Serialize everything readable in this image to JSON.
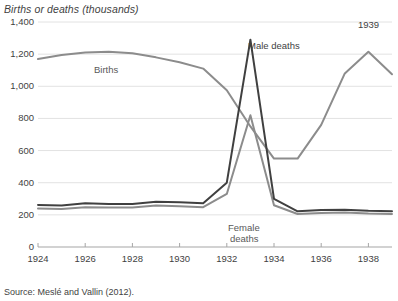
{
  "axis_title": "Births or deaths (thousands)",
  "source_note": "Source: Meslé and Vallin (2012).",
  "annotations": {
    "births": "Births",
    "male_deaths": "Male deaths",
    "female_deaths_line1": "Female",
    "female_deaths_line2": "deaths",
    "year_marker": "1939"
  },
  "colors": {
    "births_line": "#8c8c8c",
    "female_line": "#8c8c8c",
    "male_line": "#404040",
    "gridline": "#e2e2e2",
    "axis": "#a6a6a6",
    "text": "#3f3f3f"
  },
  "chart_data": {
    "type": "line",
    "title": "",
    "subtitle": "",
    "xlabel": "",
    "ylabel": "Births or deaths (thousands)",
    "ylim": [
      0,
      1400
    ],
    "xlim": [
      1924,
      1939
    ],
    "ytick_labels": [
      "0",
      "200",
      "400",
      "600",
      "800",
      "1,000",
      "1,200",
      "1,400"
    ],
    "ytick_values": [
      0,
      200,
      400,
      600,
      800,
      1000,
      1200,
      1400
    ],
    "xtick_labels": [
      "1924",
      "1926",
      "1928",
      "1930",
      "1932",
      "1934",
      "1936",
      "1938"
    ],
    "xtick_values": [
      1924,
      1926,
      1928,
      1930,
      1932,
      1934,
      1936,
      1938
    ],
    "grid": true,
    "legend": "annotations-inline",
    "x": [
      1924,
      1925,
      1926,
      1927,
      1928,
      1929,
      1930,
      1931,
      1932,
      1933,
      1934,
      1935,
      1936,
      1937,
      1938,
      1939
    ],
    "series": [
      {
        "name": "Births",
        "color": "#8c8c8c",
        "values": [
          1170,
          1195,
          1210,
          1215,
          1205,
          1180,
          1150,
          1110,
          975,
          750,
          550,
          550,
          760,
          1080,
          1215,
          1075
        ]
      },
      {
        "name": "Male deaths",
        "color": "#404040",
        "values": [
          262,
          258,
          272,
          268,
          268,
          282,
          278,
          272,
          400,
          1290,
          300,
          222,
          230,
          232,
          225,
          222
        ]
      },
      {
        "name": "Female deaths",
        "color": "#8c8c8c",
        "values": [
          240,
          236,
          248,
          246,
          246,
          258,
          254,
          248,
          330,
          820,
          260,
          205,
          212,
          215,
          208,
          205
        ]
      }
    ]
  }
}
